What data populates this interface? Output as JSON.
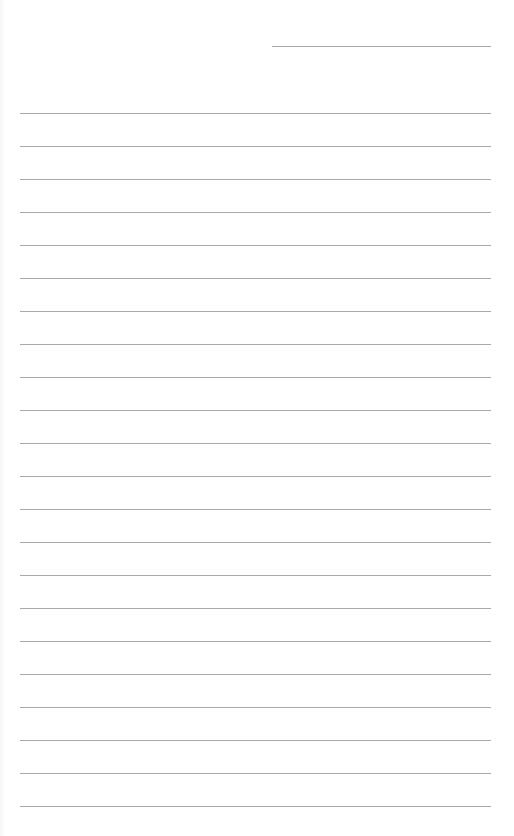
{
  "page": {
    "type": "blank lined paper",
    "background_color": "#ffffff",
    "rule_color": "#a9a9a9"
  },
  "header_line": {
    "x": 272,
    "y": 46,
    "width": 219
  },
  "body_lines": {
    "count": 22,
    "start_y": 113,
    "spacing": 33,
    "x": 20,
    "width": 471
  }
}
